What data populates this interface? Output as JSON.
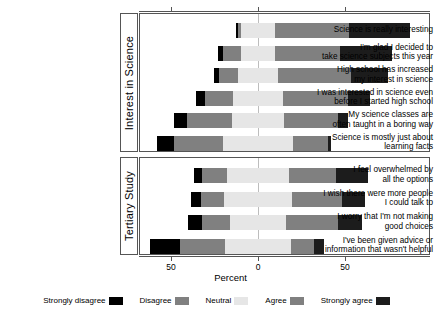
{
  "chart_data": {
    "type": "bar",
    "subtype": "diverging-stacked-likert",
    "title": "",
    "xlabel": "Percent",
    "ylabel": "",
    "xlim": [
      -70,
      80
    ],
    "xticks": [
      -50,
      0,
      50
    ],
    "xticklabels": [
      "50",
      "0",
      "50"
    ],
    "grid": false,
    "legend_position": "bottom",
    "legend": [
      "Strongly disagree",
      "Disagree",
      "Neutral",
      "Agree",
      "Strongly agree"
    ],
    "colors": {
      "strongly_disagree": "#000000",
      "disagree": "#808080",
      "neutral": "#e6e6e6",
      "agree": "#808080",
      "strongly_agree": "#1c1c1c",
      "panel_border": "#555555",
      "zero_line": "#bdbdbd"
    },
    "panels": [
      {
        "name": "Interest in Science",
        "items": [
          {
            "label": "Science is really interesting",
            "values": {
              "strongly_disagree": 1,
              "disagree": 2,
              "neutral": 19,
              "agree": 43,
              "strongly_agree": 35
            },
            "left_extent": -12.5,
            "right_extent": 87.5
          },
          {
            "label": "I'm glad I decided to\ntake science subjects this year",
            "values": {
              "strongly_disagree": 3,
              "disagree": 10,
              "neutral": 20,
              "agree": 37,
              "strongly_agree": 30
            },
            "left_extent": -23,
            "right_extent": 77
          },
          {
            "label": "High school has increased\nmy interest in science",
            "values": {
              "strongly_disagree": 3,
              "disagree": 11,
              "neutral": 23,
              "agree": 42,
              "strongly_agree": 21
            },
            "left_extent": -25.5,
            "right_extent": 74.5
          },
          {
            "label": "I was interested in science even\nbefore I started high school",
            "values": {
              "strongly_disagree": 5,
              "disagree": 16,
              "neutral": 29,
              "agree": 37,
              "strongly_agree": 13
            },
            "left_extent": -35.5,
            "right_extent": 64.5
          },
          {
            "label": "My science classes are\noften taught in a boring way",
            "values": {
              "strongly_disagree": 7,
              "disagree": 26,
              "neutral": 30,
              "agree": 31,
              "strongly_agree": 6
            },
            "left_extent": -48,
            "right_extent": 52
          },
          {
            "label": "Science is mostly just about\nlearning facts",
            "values": {
              "strongly_disagree": 10,
              "disagree": 28,
              "neutral": 40,
              "agree": 20,
              "strongly_agree": 2
            },
            "left_extent": -58,
            "right_extent": 42
          }
        ]
      },
      {
        "name": "Tertiary Study",
        "items": [
          {
            "label": "I feel overwhelmed by\nall the options",
            "values": {
              "strongly_disagree": 5,
              "disagree": 14,
              "neutral": 36,
              "agree": 27,
              "strongly_agree": 18
            },
            "left_extent": -37,
            "right_extent": 63
          },
          {
            "label": "I wish there were more people\nI could talk to",
            "values": {
              "strongly_disagree": 6,
              "disagree": 13,
              "neutral": 39,
              "agree": 29,
              "strongly_agree": 13
            },
            "left_extent": -38.5,
            "right_extent": 61.5
          },
          {
            "label": "I worry that I'm not making\ngood choices",
            "values": {
              "strongly_disagree": 8,
              "disagree": 16,
              "neutral": 32,
              "agree": 30,
              "strongly_agree": 14
            },
            "left_extent": -40,
            "right_extent": 60
          },
          {
            "label": "I've been given advice or\ninformation that wasn't helpful",
            "values": {
              "strongly_disagree": 17,
              "disagree": 26,
              "neutral": 38,
              "agree": 13,
              "strongly_agree": 6
            },
            "left_extent": -62,
            "right_extent": 38
          }
        ]
      }
    ]
  },
  "axis": {
    "title": "Percent",
    "ticks": [
      {
        "label": "50",
        "value": -50
      },
      {
        "label": "0",
        "value": 0
      },
      {
        "label": "50",
        "value": 50
      }
    ]
  },
  "legend": {
    "items": [
      {
        "label": "Strongly disagree",
        "color": "#000000"
      },
      {
        "label": "Disagree",
        "color": "#808080"
      },
      {
        "label": "Neutral",
        "color": "#e6e6e6"
      },
      {
        "label": "Agree",
        "color": "#808080"
      },
      {
        "label": "Strongly agree",
        "color": "#1c1c1c"
      }
    ]
  },
  "panel_titles": {
    "interest": "Interest in Science",
    "tertiary": "Tertiary Study"
  }
}
